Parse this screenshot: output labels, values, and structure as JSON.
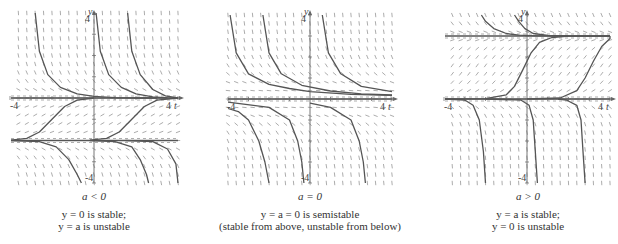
{
  "chart_data": [
    {
      "type": "line",
      "title": "a < 0",
      "caption": [
        "y = 0 is stable;",
        "y = a is unstable"
      ],
      "xlabel": "t",
      "ylabel": "y",
      "xlim": [
        -4,
        4
      ],
      "ylim": [
        -4,
        4
      ],
      "tick_labels": {
        "x_min": "-4",
        "x_max": "4",
        "y_max": "4",
        "y_min": "-4"
      },
      "equilibria": [
        {
          "y": 0,
          "label": "y = 0",
          "stability": "stable"
        },
        {
          "y": -2,
          "label": "y = a",
          "stability": "unstable"
        }
      ],
      "a": -2,
      "direction_field": true,
      "series": [
        {
          "name": "solution above 0 (left)",
          "x": [
            -2.8,
            -2.6,
            -2.2,
            -1.6,
            -0.8,
            0,
            1,
            2,
            3
          ],
          "y": [
            4,
            2.2,
            1.1,
            0.5,
            0.2,
            0.08,
            0.02,
            0,
            0
          ]
        },
        {
          "name": "solution above 0 (middle)",
          "x": [
            0.1,
            0.3,
            0.7,
            1.3,
            2,
            2.8,
            3.5
          ],
          "y": [
            4,
            2.2,
            1.1,
            0.5,
            0.2,
            0.05,
            0
          ]
        },
        {
          "name": "solution above 0 (right)",
          "x": [
            1.6,
            1.8,
            2.2,
            2.8,
            3.4,
            4
          ],
          "y": [
            4,
            2.2,
            1.1,
            0.4,
            0.1,
            0
          ]
        },
        {
          "name": "solution between a and 0 (left)",
          "x": [
            -4,
            -3.2,
            -2.6,
            -2,
            -1.4,
            -0.8,
            0
          ],
          "y": [
            -1.98,
            -1.9,
            -1.6,
            -1,
            -0.4,
            -0.1,
            0
          ]
        },
        {
          "name": "solution between a and 0 (right)",
          "x": [
            -0.2,
            0.6,
            1.2,
            1.8,
            2.4,
            3,
            4
          ],
          "y": [
            -1.98,
            -1.9,
            -1.6,
            -1,
            -0.4,
            -0.1,
            0
          ]
        },
        {
          "name": "solution below a (left)",
          "x": [
            -4,
            -2.6,
            -1.8,
            -1.2,
            -0.8,
            -0.6
          ],
          "y": [
            -2,
            -2.05,
            -2.3,
            -2.9,
            -3.6,
            -4
          ]
        },
        {
          "name": "solution below a (middle)",
          "x": [
            -0.2,
            1,
            1.8,
            2.2,
            2.5,
            2.6
          ],
          "y": [
            -2,
            -2.05,
            -2.3,
            -2.9,
            -3.6,
            -4
          ]
        },
        {
          "name": "solution below a (right)",
          "x": [
            1.5,
            2.8,
            3.5,
            3.9,
            4.2
          ],
          "y": [
            -2,
            -2.05,
            -2.4,
            -3.1,
            -4
          ]
        }
      ]
    },
    {
      "type": "line",
      "title": "a = 0",
      "caption": [
        "y = a = 0 is semistable",
        "(stable from above, unstable from below)"
      ],
      "xlabel": "t",
      "ylabel": "y",
      "xlim": [
        -4,
        4
      ],
      "ylim": [
        -4,
        4
      ],
      "tick_labels": {
        "x_min": "-4",
        "x_max": "4",
        "y_max": "4",
        "y_min": "-4"
      },
      "equilibria": [
        {
          "y": 0,
          "label": "y = a = 0",
          "stability": "semistable"
        }
      ],
      "a": 0,
      "direction_field": true,
      "series": [
        {
          "name": "solution above 0 (1)",
          "x": [
            -3.9,
            -3.6,
            -3,
            -2,
            -1,
            0,
            2,
            4
          ],
          "y": [
            4,
            2.2,
            1.2,
            0.7,
            0.5,
            0.35,
            0.22,
            0.17
          ]
        },
        {
          "name": "solution above 0 (2)",
          "x": [
            -2.3,
            -2,
            -1.4,
            -0.4,
            1,
            2.5,
            4
          ],
          "y": [
            4,
            2.2,
            1.2,
            0.65,
            0.38,
            0.25,
            0.19
          ]
        },
        {
          "name": "solution above 0 (3)",
          "x": [
            0.6,
            0.9,
            1.5,
            2.5,
            4
          ],
          "y": [
            4,
            2.2,
            1.2,
            0.6,
            0.35
          ]
        },
        {
          "name": "solution below 0 (1)",
          "x": [
            -4,
            -3.5,
            -3,
            -2.5,
            -2.2,
            -2
          ],
          "y": [
            -0.45,
            -0.6,
            -1,
            -2,
            -3,
            -4
          ]
        },
        {
          "name": "solution below 0 (2)",
          "x": [
            -4,
            -2,
            -1,
            -0.6,
            -0.4,
            -0.3
          ],
          "y": [
            -0.15,
            -0.4,
            -1,
            -2,
            -3,
            -4
          ]
        },
        {
          "name": "solution below 0 (3)",
          "x": [
            0,
            1,
            2,
            2.4,
            2.6,
            2.7
          ],
          "y": [
            -0.2,
            -0.4,
            -1,
            -2,
            -3,
            -4
          ]
        }
      ]
    },
    {
      "type": "line",
      "title": "a > 0",
      "caption": [
        "y = a is stable;",
        "y = 0 is unstable"
      ],
      "xlabel": "t",
      "ylabel": "y",
      "xlim": [
        -4,
        4
      ],
      "ylim": [
        -4,
        4
      ],
      "tick_labels": {
        "x_min": "-4",
        "x_max": "4",
        "y_max": "4",
        "y_min": "-4"
      },
      "equilibria": [
        {
          "y": 3,
          "label": "y = a",
          "stability": "stable"
        },
        {
          "y": 0,
          "label": "y = 0",
          "stability": "unstable"
        }
      ],
      "a": 3,
      "direction_field": true,
      "series": [
        {
          "name": "solution above a (left)",
          "x": [
            -2.2,
            -2,
            -1.6,
            -1,
            -0.4,
            0.5,
            2,
            4
          ],
          "y": [
            4,
            3.7,
            3.35,
            3.12,
            3.04,
            3.01,
            3,
            3
          ]
        },
        {
          "name": "solution above a (right)",
          "x": [
            -0.6,
            -0.4,
            -0.1,
            0.3,
            1,
            2
          ],
          "y": [
            4,
            3.7,
            3.35,
            3.12,
            3.03,
            3
          ]
        },
        {
          "name": "solution between 0 and a (left)",
          "x": [
            -4,
            -2,
            -1,
            -0.6,
            -0.2,
            0.2,
            0.6,
            1.2,
            2,
            4
          ],
          "y": [
            0,
            0.02,
            0.2,
            0.6,
            1.4,
            2.2,
            2.7,
            2.93,
            2.99,
            3
          ]
        },
        {
          "name": "solution between 0 and a (right)",
          "x": [
            0,
            1.6,
            2.4,
            2.8,
            3.2,
            3.6,
            4,
            4.5
          ],
          "y": [
            0,
            0.05,
            0.4,
            1,
            1.8,
            2.5,
            2.88,
            3
          ]
        },
        {
          "name": "solution below 0 (left)",
          "x": [
            -4,
            -3,
            -2.6,
            -2.3,
            -2.1,
            -2
          ],
          "y": [
            0,
            -0.05,
            -0.3,
            -1,
            -2.5,
            -4
          ]
        },
        {
          "name": "solution below 0 (middle)",
          "x": [
            -2,
            -0.3,
            0.1,
            0.3,
            0.4,
            0.5
          ],
          "y": [
            0,
            -0.05,
            -0.3,
            -1,
            -2.5,
            -4
          ]
        },
        {
          "name": "solution below 0 (right)",
          "x": [
            1.5,
            1.9,
            2.4,
            2.6,
            2.7,
            2.8
          ],
          "y": [
            0,
            -0.05,
            -0.3,
            -1,
            -2.5,
            -4
          ]
        }
      ]
    }
  ],
  "panels": [
    {
      "title": "a < 0",
      "caption_line1": "y = 0 is stable;",
      "caption_line2": "y = a is unstable"
    },
    {
      "title": "a = 0",
      "caption_line1": "y = a = 0 is semistable",
      "caption_line2": "(stable from above, unstable from below)"
    },
    {
      "title": "a > 0",
      "caption_line1": "y = a is stable;",
      "caption_line2": "y = 0 is unstable"
    }
  ],
  "colors": {
    "curve": "#555555",
    "axis": "#666666",
    "field": "#888888",
    "dashed": "#777777"
  }
}
